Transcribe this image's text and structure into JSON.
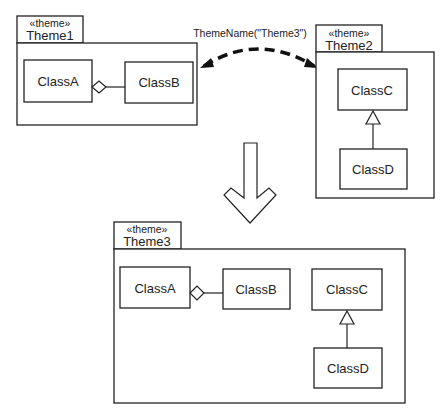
{
  "diagram": {
    "themes": [
      {
        "id": "theme1",
        "stereotype": "«theme»",
        "name": "Theme1",
        "classes": [
          "ClassA",
          "ClassB"
        ],
        "relations": [
          {
            "type": "aggregation",
            "from": "ClassA",
            "to": "ClassB"
          }
        ]
      },
      {
        "id": "theme2",
        "stereotype": "«theme»",
        "name": "Theme2",
        "classes": [
          "ClassC",
          "ClassD"
        ],
        "relations": [
          {
            "type": "generalization",
            "from": "ClassD",
            "to": "ClassC"
          }
        ]
      },
      {
        "id": "theme3",
        "stereotype": "«theme»",
        "name": "Theme3",
        "classes": [
          "ClassA",
          "ClassB",
          "ClassC",
          "ClassD"
        ],
        "relations": [
          {
            "type": "aggregation",
            "from": "ClassA",
            "to": "ClassB"
          },
          {
            "type": "generalization",
            "from": "ClassD",
            "to": "ClassC"
          }
        ]
      }
    ],
    "merge_relation": {
      "label": "ThemeName(\"Theme3\")",
      "style": "dashed-bidirectional",
      "between": [
        "Theme1",
        "Theme2"
      ]
    },
    "result_arrow": {
      "style": "hollow-down-arrow",
      "meaning": "produces"
    }
  }
}
